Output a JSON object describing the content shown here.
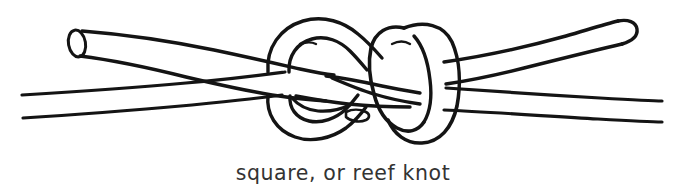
{
  "figure": {
    "title": "square, or reef knot",
    "caption": "square, or reef knot",
    "background_color": "#ffffff",
    "ink_color": "#141414",
    "caption_color": "#333333",
    "illustration": {
      "name": "square-knot-line-drawing",
      "style": "hand-drawn pen and ink outline",
      "subject": "square (reef) knot tied with two ropes",
      "parts": [
        {
          "name": "upper-left-rope-end",
          "description": "rope end at upper left with elliptical cut face, running diagonally down to the right into the knot"
        },
        {
          "name": "upper-right-rope-end",
          "description": "rope end at upper right with rounded closed tip, rising to the right out of the knot"
        },
        {
          "name": "lower-left-standing-part",
          "description": "rope running off the left edge below center as a pair of outline lines"
        },
        {
          "name": "lower-right-standing-part",
          "description": "rope running off toward the right edge below center as a pair of outline lines"
        },
        {
          "name": "left-bight",
          "description": "left loop of the knot arcing over the top and around the bottom"
        },
        {
          "name": "right-bight",
          "description": "vertical loop on the right side of the knot encircling the crossing ropes"
        },
        {
          "name": "central-crossing",
          "description": "interlocking crossings at the middle of the knot"
        }
      ]
    }
  }
}
